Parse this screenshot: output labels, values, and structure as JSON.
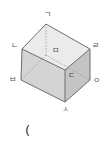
{
  "figure": {
    "type": "rectangular-prism",
    "vertices": {
      "g": "ㄱ",
      "n": "ㄴ",
      "d": "ㄷ",
      "r": "ㄹ",
      "m": "ㅁ",
      "b": "ㅂ",
      "s": "ㅅ",
      "o": "ㅇ"
    },
    "colors": {
      "top_face": "#ebebeb",
      "front_face": "#d4d4d4",
      "side_face": "#c4c4c4",
      "edge": "#6e6e6e",
      "hidden_edge": "#9a9a9a"
    }
  },
  "answer_blank": "("
}
